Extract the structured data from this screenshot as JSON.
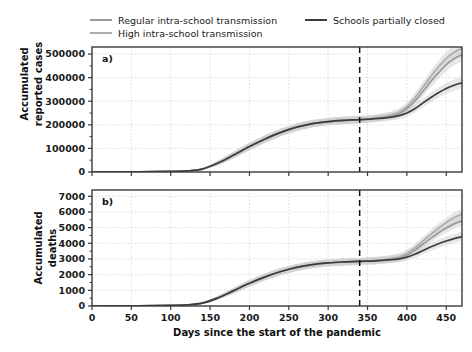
{
  "figure": {
    "background": "#ffffff",
    "colors": {
      "regular_line": "#9a9a9a",
      "high_line": "#adadad",
      "closed_line": "#3c3c3c",
      "band": "#c9c9c9",
      "axis": "#3a3a3a",
      "grid": "#c4c4c4",
      "text": "#1a1a1a"
    }
  },
  "legend": {
    "position": "top",
    "entries": [
      {
        "label": "Regular intra-school transmission",
        "color": "#9a9a9a",
        "marker": "line"
      },
      {
        "label": "High intra-school transmission",
        "color": "#adadad",
        "marker": "line"
      },
      {
        "label": "Schools partially closed",
        "color": "#3c3c3c",
        "marker": "line"
      }
    ]
  },
  "annotations": {
    "panel_a_label": "a)",
    "panel_b_label": "b)",
    "vline_day": 340,
    "vline_style": "dashed"
  },
  "chart_data": [
    {
      "type": "line",
      "panel": "a",
      "title": "",
      "xlabel": "",
      "ylabel": "Accumulated\nreported cases",
      "ylabel_line1": "Accumulated",
      "ylabel_line2": "reported cases",
      "xlim": [
        0,
        470
      ],
      "ylim": [
        0,
        530000
      ],
      "xticks": [
        0,
        50,
        100,
        150,
        200,
        250,
        300,
        350,
        400,
        450
      ],
      "xticklabels": [
        "0",
        "50",
        "100",
        "150",
        "200",
        "250",
        "300",
        "350",
        "400",
        "450"
      ],
      "yticks": [
        0,
        100000,
        200000,
        300000,
        400000,
        500000
      ],
      "yticklabels": [
        "0",
        "100000",
        "200000",
        "300000",
        "400000",
        "500000"
      ],
      "grid": true,
      "x": [
        0,
        20,
        40,
        60,
        80,
        100,
        120,
        140,
        160,
        180,
        200,
        220,
        240,
        260,
        280,
        300,
        320,
        340,
        360,
        380,
        390,
        400,
        410,
        420,
        430,
        440,
        450,
        460,
        470
      ],
      "series": [
        {
          "name": "Regular intra-school transmission",
          "color": "#9a9a9a",
          "values": [
            0,
            200,
            500,
            900,
            1500,
            2500,
            4500,
            12000,
            38000,
            72000,
            108000,
            140000,
            168000,
            190000,
            205000,
            214000,
            219000,
            222000,
            228000,
            238000,
            248000,
            268000,
            300000,
            340000,
            382000,
            420000,
            455000,
            480000,
            497000
          ],
          "band_lower": [
            0,
            100,
            300,
            600,
            1000,
            1800,
            3400,
            8500,
            28000,
            58000,
            92000,
            124000,
            152000,
            174000,
            190000,
            199000,
            204000,
            207000,
            213000,
            222000,
            231000,
            250000,
            280000,
            318000,
            358000,
            394000,
            428000,
            452000,
            468000
          ],
          "band_upper": [
            0,
            400,
            900,
            1500,
            2400,
            3600,
            6200,
            16000,
            48000,
            86000,
            124000,
            156000,
            184000,
            206000,
            220000,
            229000,
            234000,
            237000,
            243000,
            254000,
            265000,
            286000,
            320000,
            362000,
            406000,
            446000,
            482000,
            508000,
            526000
          ]
        },
        {
          "name": "High intra-school transmission",
          "color": "#adadad",
          "values": [
            0,
            200,
            500,
            900,
            1500,
            2500,
            4500,
            12000,
            38000,
            72000,
            108000,
            140000,
            168000,
            190000,
            205000,
            214000,
            219000,
            222000,
            229000,
            241000,
            253000,
            277000,
            314000,
            358000,
            404000,
            446000,
            482000,
            508000,
            524000
          ],
          "band_lower": [
            0,
            100,
            300,
            600,
            1000,
            1800,
            3400,
            8500,
            28000,
            58000,
            92000,
            124000,
            152000,
            174000,
            190000,
            199000,
            204000,
            207000,
            214000,
            225000,
            236000,
            259000,
            294000,
            336000,
            380000,
            420000,
            455000,
            480000,
            496000
          ],
          "band_upper": [
            0,
            400,
            900,
            1500,
            2400,
            3600,
            6200,
            16000,
            48000,
            86000,
            124000,
            156000,
            184000,
            206000,
            220000,
            229000,
            234000,
            237000,
            244000,
            257000,
            270000,
            295000,
            334000,
            380000,
            428000,
            472000,
            509000,
            536000,
            552000
          ]
        },
        {
          "name": "Schools partially closed",
          "color": "#3c3c3c",
          "values": [
            0,
            200,
            500,
            900,
            1500,
            2500,
            4500,
            12000,
            38000,
            72000,
            108000,
            140000,
            168000,
            190000,
            205000,
            214000,
            219000,
            222000,
            226000,
            233000,
            239000,
            250000,
            268000,
            292000,
            315000,
            336000,
            354000,
            368000,
            378000
          ],
          "band_lower": [
            0,
            100,
            300,
            600,
            1000,
            1800,
            3400,
            8500,
            28000,
            58000,
            92000,
            124000,
            152000,
            174000,
            190000,
            199000,
            204000,
            207000,
            211000,
            218000,
            224000,
            234000,
            251000,
            273000,
            295000,
            315000,
            332000,
            345000,
            354000
          ],
          "band_upper": [
            0,
            400,
            900,
            1500,
            2400,
            3600,
            6200,
            16000,
            48000,
            86000,
            124000,
            156000,
            184000,
            206000,
            220000,
            229000,
            234000,
            237000,
            241000,
            248000,
            255000,
            266000,
            286000,
            311000,
            336000,
            358000,
            377000,
            392000,
            403000
          ]
        }
      ]
    },
    {
      "type": "line",
      "panel": "b",
      "title": "",
      "xlabel": "Days since the start of the pandemic",
      "ylabel": "Accumulated\ndeaths",
      "ylabel_line1": "Accumulated",
      "ylabel_line2": "deaths",
      "xlim": [
        0,
        470
      ],
      "ylim": [
        0,
        7400
      ],
      "xticks": [
        0,
        50,
        100,
        150,
        200,
        250,
        300,
        350,
        400,
        450
      ],
      "xticklabels": [
        "0",
        "50",
        "100",
        "150",
        "200",
        "250",
        "300",
        "350",
        "400",
        "450"
      ],
      "yticks": [
        0,
        1000,
        2000,
        3000,
        4000,
        5000,
        6000,
        7000
      ],
      "yticklabels": [
        "0",
        "1000",
        "2000",
        "3000",
        "4000",
        "5000",
        "6000",
        "7000"
      ],
      "grid": true,
      "x": [
        0,
        20,
        40,
        60,
        80,
        100,
        120,
        140,
        160,
        180,
        200,
        220,
        240,
        260,
        280,
        300,
        320,
        340,
        360,
        380,
        390,
        400,
        410,
        420,
        430,
        440,
        450,
        460,
        470
      ],
      "series": [
        {
          "name": "Regular intra-school transmission",
          "color": "#9a9a9a",
          "values": [
            0,
            2,
            6,
            12,
            22,
            38,
            70,
            180,
            520,
            980,
            1450,
            1860,
            2200,
            2460,
            2640,
            2750,
            2810,
            2850,
            2900,
            2990,
            3070,
            3250,
            3550,
            3920,
            4300,
            4660,
            4980,
            5240,
            5440
          ],
          "band_lower": [
            0,
            1,
            3,
            8,
            15,
            28,
            52,
            135,
            400,
            800,
            1250,
            1650,
            1980,
            2240,
            2420,
            2530,
            2590,
            2620,
            2670,
            2760,
            2840,
            3010,
            3300,
            3660,
            4030,
            4380,
            4690,
            4950,
            5140
          ],
          "band_upper": [
            0,
            4,
            10,
            18,
            32,
            52,
            92,
            235,
            650,
            1170,
            1660,
            2080,
            2420,
            2680,
            2860,
            2970,
            3030,
            3070,
            3130,
            3230,
            3320,
            3510,
            3830,
            4220,
            4620,
            5000,
            5340,
            5620,
            5830
          ]
        },
        {
          "name": "High intra-school transmission",
          "color": "#adadad",
          "values": [
            0,
            2,
            6,
            12,
            22,
            38,
            70,
            180,
            520,
            980,
            1450,
            1860,
            2200,
            2460,
            2640,
            2750,
            2810,
            2850,
            2915,
            3025,
            3130,
            3350,
            3700,
            4120,
            4550,
            4960,
            5330,
            5640,
            5880
          ],
          "band_lower": [
            0,
            1,
            3,
            8,
            15,
            28,
            52,
            135,
            400,
            800,
            1250,
            1650,
            1980,
            2240,
            2420,
            2530,
            2590,
            2620,
            2685,
            2790,
            2890,
            3100,
            3440,
            3850,
            4270,
            4670,
            5030,
            5330,
            5560
          ],
          "band_upper": [
            0,
            4,
            10,
            18,
            32,
            52,
            92,
            235,
            650,
            1170,
            1660,
            2080,
            2420,
            2680,
            2860,
            2970,
            3030,
            3070,
            3140,
            3260,
            3370,
            3600,
            3970,
            4400,
            4850,
            5270,
            5650,
            5970,
            6220
          ]
        },
        {
          "name": "Schools partially closed",
          "color": "#3c3c3c",
          "values": [
            0,
            2,
            6,
            12,
            22,
            38,
            70,
            180,
            520,
            980,
            1450,
            1860,
            2200,
            2460,
            2640,
            2750,
            2810,
            2850,
            2885,
            2955,
            3010,
            3120,
            3300,
            3530,
            3760,
            3970,
            4150,
            4300,
            4420
          ],
          "band_lower": [
            0,
            1,
            3,
            8,
            15,
            28,
            52,
            135,
            400,
            800,
            1250,
            1650,
            1980,
            2240,
            2420,
            2530,
            2590,
            2620,
            2655,
            2725,
            2780,
            2890,
            3065,
            3290,
            3515,
            3720,
            3895,
            4040,
            4155
          ],
          "band_upper": [
            0,
            4,
            10,
            18,
            32,
            52,
            92,
            235,
            650,
            1170,
            1660,
            2080,
            2420,
            2680,
            2860,
            2970,
            3030,
            3070,
            3105,
            3180,
            3235,
            3350,
            3535,
            3775,
            4020,
            4240,
            4430,
            4590,
            4715
          ]
        }
      ]
    }
  ]
}
